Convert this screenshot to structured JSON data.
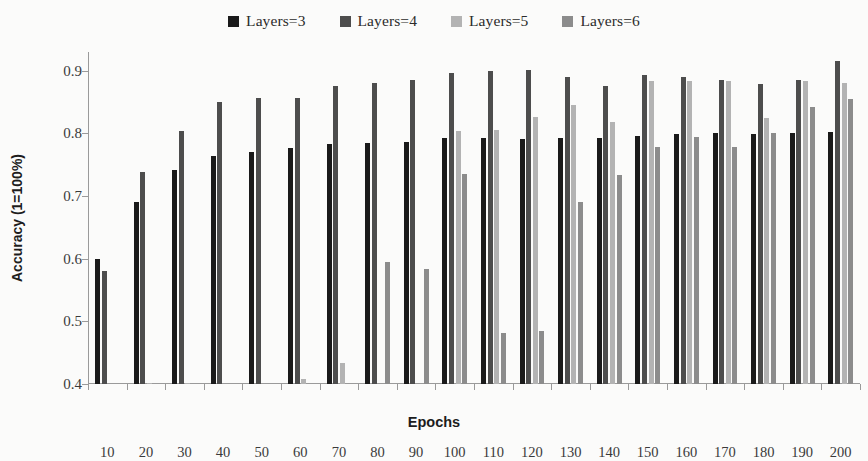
{
  "chart_data": {
    "type": "bar",
    "title": "",
    "xlabel": "Epochs",
    "ylabel": "Accuracy (1=100%)",
    "ylim": [
      0.4,
      0.93
    ],
    "yticks": [
      0.4,
      0.5,
      0.6,
      0.7,
      0.8,
      0.9
    ],
    "ytick_labels": [
      "0.4",
      "0.5",
      "0.6",
      "0.7",
      "0.8",
      "0.9"
    ],
    "grid": false,
    "legend_position": "top-center",
    "categories": [
      10,
      20,
      30,
      40,
      50,
      60,
      70,
      80,
      90,
      100,
      110,
      120,
      130,
      140,
      150,
      160,
      170,
      180,
      190,
      200
    ],
    "category_labels": [
      "10",
      "20",
      "30",
      "40",
      "50",
      "60",
      "70",
      "80",
      "90",
      "100",
      "110",
      "120",
      "130",
      "140",
      "150",
      "160",
      "170",
      "180",
      "190",
      "200"
    ],
    "series": [
      {
        "name": "Layers=3",
        "color": "#1a1a1a",
        "values": [
          0.6,
          0.691,
          0.741,
          0.764,
          0.77,
          0.776,
          0.783,
          0.785,
          0.787,
          0.792,
          0.793,
          0.791,
          0.793,
          0.793,
          0.796,
          0.799,
          0.8,
          0.799,
          0.801,
          0.802
        ]
      },
      {
        "name": "Layers=4",
        "color": "#4d4d4d",
        "values": [
          0.58,
          0.738,
          0.804,
          0.851,
          0.857,
          0.857,
          0.876,
          0.88,
          0.886,
          0.897,
          0.899,
          0.902,
          0.89,
          0.876,
          0.893,
          0.89,
          0.885,
          0.879,
          0.886,
          0.915
        ]
      },
      {
        "name": "Layers=5",
        "color": "#b3b3b3",
        "values": [
          0.4,
          0.402,
          0.402,
          0.4,
          0.4,
          0.408,
          0.434,
          0.4,
          0.4,
          0.804,
          0.806,
          0.826,
          0.846,
          0.818,
          0.884,
          0.884,
          0.884,
          0.824,
          0.884,
          0.88
        ]
      },
      {
        "name": "Layers=6",
        "color": "#8c8c8c",
        "values": [
          0.4,
          0.4,
          0.4,
          0.4,
          0.4,
          0.4,
          0.4,
          0.595,
          0.583,
          0.736,
          0.481,
          0.484,
          0.69,
          0.733,
          0.779,
          0.794,
          0.778,
          0.8,
          0.843,
          0.855
        ]
      }
    ]
  },
  "legend": {
    "items": [
      {
        "label": "Layers=3",
        "color": "#1a1a1a"
      },
      {
        "label": "Layers=4",
        "color": "#4d4d4d"
      },
      {
        "label": "Layers=5",
        "color": "#b3b3b3"
      },
      {
        "label": "Layers=6",
        "color": "#8c8c8c"
      }
    ]
  }
}
